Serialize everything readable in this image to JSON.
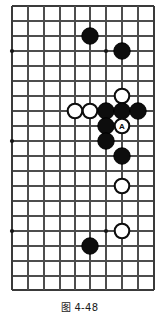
{
  "figure": {
    "caption": "图 4-48",
    "board": {
      "columns": 10,
      "rows": 20,
      "x_coords": [
        12,
        28,
        44,
        60,
        75,
        90,
        106,
        122,
        138,
        154
      ],
      "y_coords": [
        6,
        21,
        36,
        51,
        66,
        81,
        96,
        111,
        126,
        141,
        156,
        171,
        186,
        201,
        216,
        231,
        246,
        261,
        276,
        290
      ],
      "line_color": "#4d4d4d",
      "background_color": "#ffffff",
      "stone_radius": 8.2,
      "star_points": [
        {
          "col": 0,
          "row": 3
        },
        {
          "col": 6,
          "row": 3
        },
        {
          "col": 0,
          "row": 9
        },
        {
          "col": 0,
          "row": 15
        },
        {
          "col": 6,
          "row": 15
        }
      ],
      "stones": [
        {
          "col": 5,
          "row": 2,
          "color": "black",
          "label": ""
        },
        {
          "col": 7,
          "row": 3,
          "color": "black",
          "label": ""
        },
        {
          "col": 7,
          "row": 6,
          "color": "white",
          "label": ""
        },
        {
          "col": 4,
          "row": 7,
          "color": "white",
          "label": ""
        },
        {
          "col": 5,
          "row": 7,
          "color": "white",
          "label": ""
        },
        {
          "col": 6,
          "row": 7,
          "color": "black",
          "label": ""
        },
        {
          "col": 7,
          "row": 7,
          "color": "black",
          "label": ""
        },
        {
          "col": 6,
          "row": 8,
          "color": "black",
          "label": ""
        },
        {
          "col": 7,
          "row": 8,
          "color": "white",
          "label": "A"
        },
        {
          "col": 6,
          "row": 9,
          "color": "black",
          "label": ""
        },
        {
          "col": 7,
          "row": 10,
          "color": "black",
          "label": ""
        },
        {
          "col": 7,
          "row": 12,
          "color": "white",
          "label": ""
        },
        {
          "col": 7,
          "row": 15,
          "color": "white",
          "label": ""
        },
        {
          "col": 5,
          "row": 16,
          "color": "black",
          "label": ""
        }
      ],
      "extra_stones": [
        {
          "cx": 138,
          "cy": 111,
          "color": "black",
          "label": ""
        }
      ]
    }
  }
}
